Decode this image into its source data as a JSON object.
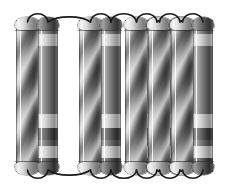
{
  "figure": {
    "title": "Coiled tube bundle illustration",
    "description": "Row of vertical cylindrical tubes arranged in connected pairs, joined by semicircular arc bends at the top and bottom, forming a continuous serpentine coil. Rendered in grayscale with airbrush shading.",
    "canvas": {
      "width": 237,
      "height": 189,
      "background": "#ffffff"
    },
    "style": {
      "render": "grayscale-airbrush",
      "outline_color": "#1a1a1a",
      "highlight_color": "#f6f6f6",
      "shadow_color": "#272727",
      "midtone_color": "#8a8a8a"
    },
    "geometry": {
      "tube_top_y": 20,
      "tube_bottom_y": 172,
      "cap_height": 13,
      "arc_stroke_width": 1.6
    },
    "tubes": [
      {
        "id": "tube-1",
        "x": 16,
        "width": 23,
        "surface": "spiral",
        "cap": "light",
        "pair": 1,
        "role": "outer"
      },
      {
        "id": "tube-2",
        "x": 38,
        "width": 20,
        "surface": "banded",
        "cap": "dark",
        "pair": 1,
        "role": "inner"
      },
      {
        "id": "tube-3",
        "x": 79,
        "width": 23,
        "surface": "spiral",
        "cap": "light",
        "pair": 2,
        "role": "outer"
      },
      {
        "id": "tube-4",
        "x": 101,
        "width": 20,
        "surface": "banded",
        "cap": "dark",
        "pair": 2,
        "role": "inner"
      },
      {
        "id": "tube-5",
        "x": 125,
        "width": 23,
        "surface": "spiral",
        "cap": "light",
        "pair": 3,
        "role": "outer"
      },
      {
        "id": "tube-6",
        "x": 147,
        "width": 20,
        "surface": "banded",
        "cap": "dark",
        "pair": 3,
        "role": "inner"
      },
      {
        "id": "tube-7",
        "x": 148,
        "width": 23,
        "surface": "spiral",
        "cap": "light",
        "pair": 4,
        "role": "outer"
      },
      {
        "id": "tube-8",
        "x": 170,
        "width": 20,
        "surface": "banded",
        "cap": "dark",
        "pair": 4,
        "role": "inner"
      },
      {
        "id": "tube-9",
        "x": 171,
        "width": 23,
        "surface": "spiral",
        "cap": "light",
        "pair": 5,
        "role": "outer"
      },
      {
        "id": "tube-10",
        "x": 193,
        "width": 20,
        "surface": "banded",
        "cap": "dark",
        "pair": 5,
        "role": "inner"
      }
    ],
    "band_pattern": {
      "description": "Narrow banded tubes carry a light collar below the cap and alternating light and dark collars toward the base.",
      "bands": [
        {
          "top_pct": 9,
          "height_pct": 8,
          "tone": "light"
        },
        {
          "top_pct": 62,
          "height_pct": 9,
          "tone": "light"
        },
        {
          "top_pct": 71,
          "height_pct": 8,
          "tone": "dark"
        },
        {
          "top_pct": 79,
          "height_pct": 4,
          "tone": "mid"
        },
        {
          "top_pct": 83,
          "height_pct": 8,
          "tone": "light"
        },
        {
          "top_pct": 91,
          "height_pct": 9,
          "tone": "dark"
        }
      ]
    },
    "arcs": {
      "description": "Thin black arcs link adjacent tube tops and bottoms; one long flat bridge spans the wide gap on the left.",
      "top": [
        {
          "id": "arc-top-1",
          "from": "tube-1",
          "to": "tube-2",
          "type": "short-bend"
        },
        {
          "id": "arc-top-2",
          "from": "tube-2",
          "to": "tube-3",
          "type": "long-bridge"
        },
        {
          "id": "arc-top-3",
          "from": "tube-3",
          "to": "tube-4",
          "type": "short-bend"
        },
        {
          "id": "arc-top-4",
          "from": "tube-4",
          "to": "tube-5",
          "type": "short-bend"
        },
        {
          "id": "arc-top-5",
          "from": "tube-5",
          "to": "tube-6",
          "type": "short-bend"
        },
        {
          "id": "arc-top-6",
          "from": "tube-6",
          "to": "tube-7",
          "type": "short-bend"
        },
        {
          "id": "arc-top-7",
          "from": "tube-7",
          "to": "tube-8",
          "type": "short-bend"
        },
        {
          "id": "arc-top-8",
          "from": "tube-8",
          "to": "tube-9",
          "type": "short-bend"
        },
        {
          "id": "arc-top-9",
          "from": "tube-9",
          "to": "tube-10",
          "type": "short-bend"
        }
      ],
      "bottom": [
        {
          "id": "arc-bottom-1",
          "from": "tube-1",
          "to": "tube-2",
          "type": "short-bend"
        },
        {
          "id": "arc-bottom-2",
          "from": "tube-2",
          "to": "tube-3",
          "type": "long-bridge"
        },
        {
          "id": "arc-bottom-3",
          "from": "tube-3",
          "to": "tube-4",
          "type": "short-bend"
        },
        {
          "id": "arc-bottom-4",
          "from": "tube-4",
          "to": "tube-5",
          "type": "short-bend"
        },
        {
          "id": "arc-bottom-5",
          "from": "tube-5",
          "to": "tube-6",
          "type": "short-bend"
        },
        {
          "id": "arc-bottom-6",
          "from": "tube-6",
          "to": "tube-7",
          "type": "short-bend"
        },
        {
          "id": "arc-bottom-7",
          "from": "tube-7",
          "to": "tube-8",
          "type": "short-bend"
        },
        {
          "id": "arc-bottom-8",
          "from": "tube-8",
          "to": "tube-9",
          "type": "short-bend"
        },
        {
          "id": "arc-bottom-9",
          "from": "tube-9",
          "to": "tube-10",
          "type": "short-bend"
        }
      ]
    }
  }
}
